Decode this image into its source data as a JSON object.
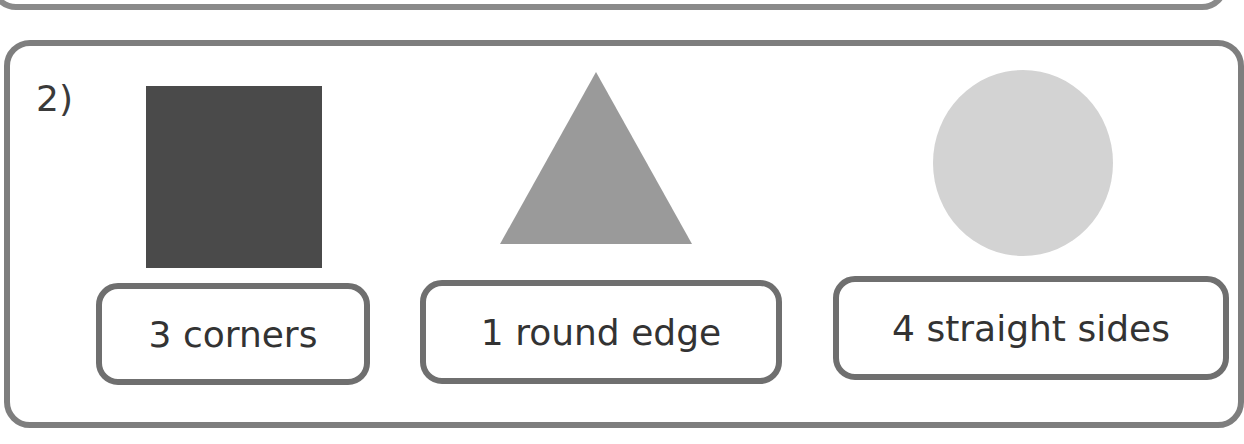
{
  "question": {
    "number": "2)",
    "shapes": [
      {
        "name": "square",
        "color": "#4a4a4a"
      },
      {
        "name": "triangle",
        "color": "#9a9a9a"
      },
      {
        "name": "circle",
        "color": "#d3d3d3"
      }
    ],
    "labels": [
      "3 corners",
      "1 round edge",
      "4 straight sides"
    ]
  }
}
